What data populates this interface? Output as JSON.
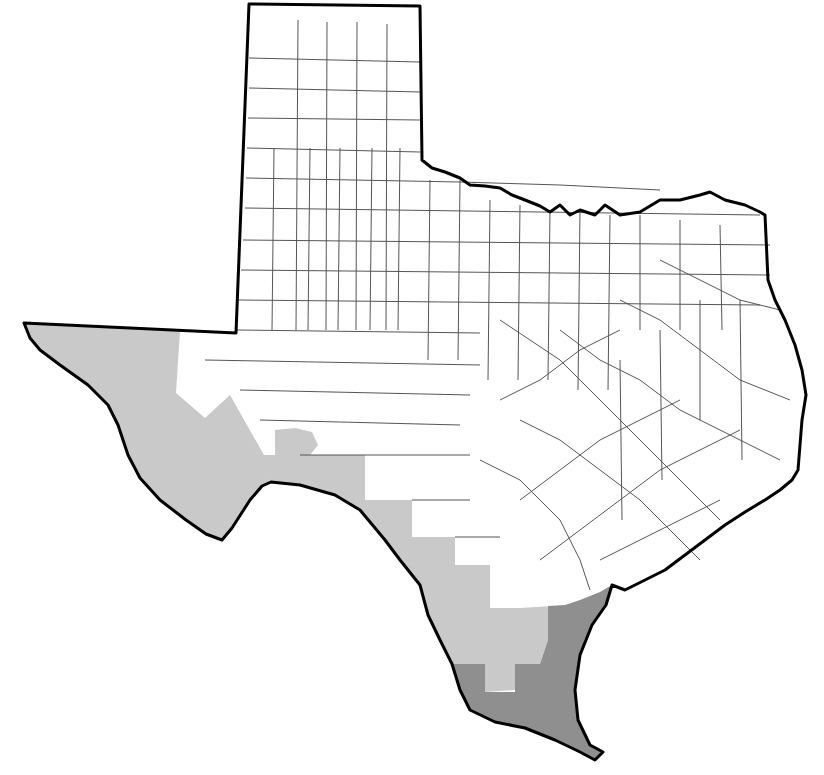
{
  "map": {
    "title": "",
    "region": "Texas",
    "subdivision": "counties",
    "colors": {
      "background": "#ffffff",
      "unshaded": "#ffffff",
      "light_shade": "#c9c9c9",
      "dark_shade": "#8f8f8f",
      "county_border": "#555555",
      "state_border": "#000000"
    },
    "legend": [],
    "shaded_regions": [
      {
        "name": "trans-pecos-west",
        "shade": "light"
      },
      {
        "name": "rio-grande-border",
        "shade": "light"
      },
      {
        "name": "south-texas-plains",
        "shade": "light"
      },
      {
        "name": "lower-rio-grande-coast",
        "shade": "dark"
      }
    ]
  }
}
